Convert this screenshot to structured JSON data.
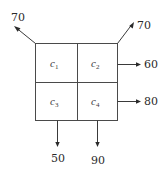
{
  "diagram": {
    "type": "2x2 grid with flow arrows",
    "cells": [
      {
        "id": "c1",
        "base": "c",
        "sub": "1",
        "row": 1,
        "col": 1
      },
      {
        "id": "c2",
        "base": "c",
        "sub": "2",
        "row": 1,
        "col": 2
      },
      {
        "id": "c3",
        "base": "c",
        "sub": "3",
        "row": 2,
        "col": 1
      },
      {
        "id": "c4",
        "base": "c",
        "sub": "4",
        "row": 2,
        "col": 2
      }
    ],
    "flows": [
      {
        "from": "top-left-corner",
        "direction": "up-left",
        "value": "70"
      },
      {
        "from": "top-right-corner",
        "direction": "up-right",
        "value": "70"
      },
      {
        "from": "c2",
        "direction": "right",
        "value": "60"
      },
      {
        "from": "c4",
        "direction": "right",
        "value": "80"
      },
      {
        "from": "c3",
        "direction": "down",
        "value": "50"
      },
      {
        "from": "c4",
        "direction": "down",
        "value": "90"
      }
    ],
    "colors": {
      "line": "#3a3a3a",
      "text": "#2a2a2a",
      "background": "#ffffff"
    }
  }
}
